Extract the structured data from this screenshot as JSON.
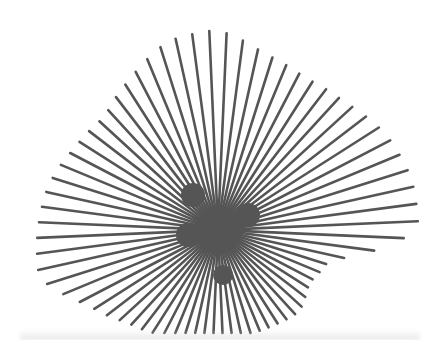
{
  "image": {
    "subject": "metal starburst wall sculpture",
    "background_color": "#ffffff",
    "ray_color": "#555555",
    "center": {
      "x": 218,
      "y": 230
    },
    "ray_count": 72,
    "ray_width": 2.6,
    "outline": [
      [
        0,
        200
      ],
      [
        15,
        200
      ],
      [
        30,
        193
      ],
      [
        45,
        180
      ],
      [
        60,
        175
      ],
      [
        75,
        182
      ],
      [
        90,
        200
      ],
      [
        105,
        195
      ],
      [
        120,
        175
      ],
      [
        135,
        160
      ],
      [
        150,
        165
      ],
      [
        165,
        175
      ],
      [
        180,
        180
      ],
      [
        195,
        185
      ],
      [
        210,
        150
      ],
      [
        225,
        130
      ],
      [
        240,
        120
      ],
      [
        255,
        125
      ],
      [
        270,
        115
      ],
      [
        285,
        108
      ],
      [
        300,
        110
      ],
      [
        315,
        115
      ],
      [
        330,
        105
      ],
      [
        345,
        115
      ]
    ]
  }
}
